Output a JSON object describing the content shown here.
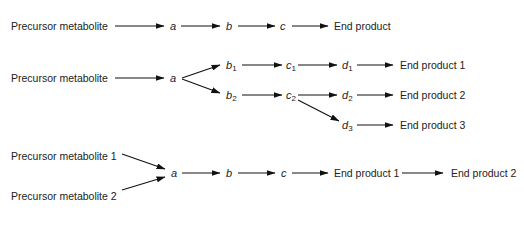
{
  "diagram": {
    "type": "metabolic pathways",
    "rows": [
      {
        "name": "linear",
        "precursor": "Precursor metabolite",
        "intermediates": [
          "a",
          "b",
          "c"
        ],
        "end_product": "End product"
      },
      {
        "name": "branched",
        "precursor": "Precursor metabolite",
        "a": "a",
        "b1": {
          "base": "b",
          "sub": "1"
        },
        "b2": {
          "base": "b",
          "sub": "2"
        },
        "c1": {
          "base": "c",
          "sub": "1"
        },
        "c2": {
          "base": "c",
          "sub": "2"
        },
        "d1": {
          "base": "d",
          "sub": "1"
        },
        "d2": {
          "base": "d",
          "sub": "2"
        },
        "d3": {
          "base": "d",
          "sub": "3"
        },
        "end_products": [
          "End product 1",
          "End product 2",
          "End product 3"
        ]
      },
      {
        "name": "converging",
        "precursors": [
          "Precursor metabolite 1",
          "Precursor metabolite 2"
        ],
        "intermediates": [
          "a",
          "b",
          "c"
        ],
        "end_products": [
          "End product 1",
          "End product 2"
        ]
      }
    ],
    "colors": {
      "line": "#111111",
      "text": "#222222"
    }
  }
}
